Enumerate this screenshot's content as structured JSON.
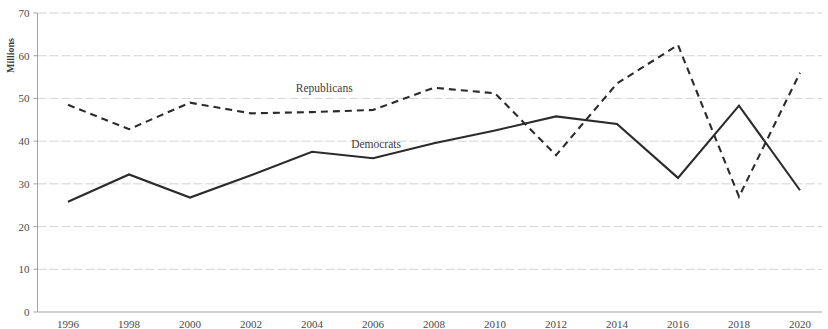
{
  "chart_data": {
    "type": "line",
    "title": "",
    "xlabel": "",
    "ylabel": "Millions",
    "xlim": [
      1996,
      2020
    ],
    "ylim": [
      0,
      70
    ],
    "grid": true,
    "legend_position": "inline-annotation",
    "x": [
      1996,
      1998,
      2000,
      2002,
      2004,
      2006,
      2008,
      2010,
      2012,
      2014,
      2016,
      2018,
      2020
    ],
    "categories": [
      "1996",
      "1998",
      "2000",
      "2002",
      "2004",
      "2006",
      "2008",
      "2010",
      "2012",
      "2014",
      "2016",
      "2018",
      "2020"
    ],
    "ytick_labels": [
      "0",
      "10",
      "20",
      "30",
      "40",
      "50",
      "60",
      "70"
    ],
    "ytick_values": [
      0,
      10,
      20,
      30,
      40,
      50,
      60,
      70
    ],
    "series": [
      {
        "name": "Republicans",
        "style": "dashed",
        "color": "#2b2b2b",
        "values": [
          48.5,
          42.8,
          49.0,
          46.5,
          46.8,
          47.3,
          52.5,
          51.2,
          36.7,
          53.5,
          62.5,
          27.0,
          56.0
        ]
      },
      {
        "name": "Democrats",
        "style": "solid",
        "color": "#2b2b2b",
        "values": [
          25.8,
          32.2,
          26.8,
          32.0,
          37.5,
          36.0,
          39.5,
          42.5,
          45.8,
          44.0,
          31.4,
          48.3,
          28.5
        ]
      }
    ],
    "annotations": [
      {
        "text": "Republicans",
        "x": 2004.4,
        "y": 51.5
      },
      {
        "text": "Democrats",
        "x": 2006.1,
        "y": 38.4
      }
    ]
  }
}
